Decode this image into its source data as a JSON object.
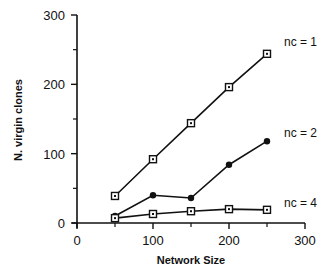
{
  "chart_data": {
    "type": "line",
    "title": "",
    "xlabel": "Network Size",
    "ylabel": "N. virgin clones",
    "xlim": [
      0,
      300
    ],
    "ylim": [
      0,
      300
    ],
    "x_ticks": [
      0,
      100,
      200,
      300
    ],
    "y_ticks": [
      0,
      100,
      200,
      300
    ],
    "x_minor_ticks": [
      50,
      150,
      250
    ],
    "y_minor_ticks": [
      50,
      150,
      250
    ],
    "grid": false,
    "legend_position": "inline-right",
    "x": [
      50,
      100,
      150,
      200,
      250
    ],
    "series": [
      {
        "name": "nc = 1",
        "marker": "square-dot",
        "values": [
          39,
          92,
          144,
          196,
          244
        ]
      },
      {
        "name": "nc = 2",
        "marker": "filled-circle",
        "values": [
          10,
          40,
          36,
          84,
          118
        ]
      },
      {
        "name": "nc = 4",
        "marker": "square-dot",
        "values": [
          7,
          13,
          17,
          20,
          19
        ]
      }
    ],
    "colors": {
      "line": "#111111",
      "background": "#ffffff"
    }
  }
}
